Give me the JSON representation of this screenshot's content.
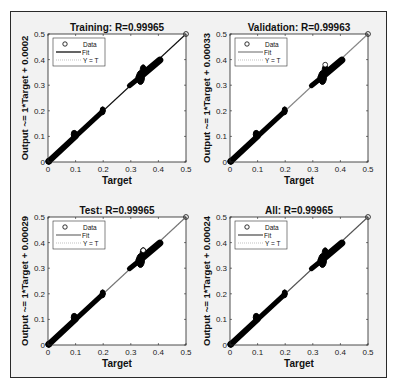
{
  "chart_data": [
    {
      "type": "scatter",
      "title": "Training: R=0.99965",
      "xlabel": "Target",
      "ylabel": "Output ~= 1*Target + 0.0002",
      "xlim": [
        0,
        0.5
      ],
      "ylim": [
        0,
        0.5
      ],
      "xticks": [
        "0",
        "0.1",
        "0.2",
        "0.3",
        "0.4",
        "0.5"
      ],
      "yticks": [
        "0",
        "0.1",
        "0.2",
        "0.3",
        "0.4",
        "0.5"
      ],
      "legend": [
        "Data",
        "Fit",
        "Y = T"
      ],
      "legend_position": "upper left",
      "fit": {
        "slope": 1,
        "intercept": 0.0002
      },
      "R": 0.99965,
      "fit_color": "#111111",
      "series": [
        {
          "name": "Data",
          "segments": [
            [
              0.0,
              0.1
            ],
            [
              0.1,
              0.2
            ],
            [
              0.29,
              0.41
            ]
          ],
          "outliers": [
            [
              0.5,
              0.5
            ]
          ]
        }
      ]
    },
    {
      "type": "scatter",
      "title": "Validation: R=0.99963",
      "xlabel": "Target",
      "ylabel": "Output ~= 1*Target + 0.00033",
      "xlim": [
        0,
        0.5
      ],
      "ylim": [
        0,
        0.5
      ],
      "xticks": [
        "0",
        "0.1",
        "0.2",
        "0.3",
        "0.4",
        "0.5"
      ],
      "yticks": [
        "0",
        "0.1",
        "0.2",
        "0.3",
        "0.4",
        "0.5"
      ],
      "legend": [
        "Data",
        "Fit",
        "Y = T"
      ],
      "legend_position": "upper left",
      "fit": {
        "slope": 1,
        "intercept": 0.00033
      },
      "R": 0.99963,
      "fit_color": "#888888",
      "series": [
        {
          "name": "Data",
          "segments": [
            [
              0.0,
              0.1
            ],
            [
              0.1,
              0.2
            ],
            [
              0.29,
              0.41
            ]
          ],
          "outliers": [
            [
              0.345,
              0.38
            ],
            [
              0.5,
              0.5
            ]
          ]
        }
      ]
    },
    {
      "type": "scatter",
      "title": "Test: R=0.99965",
      "xlabel": "Target",
      "ylabel": "Output ~= 1*Target + 0.00029",
      "xlim": [
        0,
        0.5
      ],
      "ylim": [
        0,
        0.5
      ],
      "xticks": [
        "0",
        "0.1",
        "0.2",
        "0.3",
        "0.4",
        "0.5"
      ],
      "yticks": [
        "0",
        "0.1",
        "0.2",
        "0.3",
        "0.4",
        "0.5"
      ],
      "legend": [
        "Data",
        "Fit",
        "Y = T"
      ],
      "legend_position": "upper left",
      "fit": {
        "slope": 1,
        "intercept": 0.00029
      },
      "R": 0.99965,
      "fit_color": "#777777",
      "series": [
        {
          "name": "Data",
          "segments": [
            [
              0.0,
              0.1
            ],
            [
              0.1,
              0.2
            ],
            [
              0.29,
              0.41
            ]
          ],
          "outliers": [
            [
              0.345,
              0.37
            ],
            [
              0.5,
              0.5
            ]
          ]
        }
      ]
    },
    {
      "type": "scatter",
      "title": "All: R=0.99965",
      "xlabel": "Target",
      "ylabel": "Output ~= 1*Target + 0.00024",
      "xlim": [
        0,
        0.5
      ],
      "ylim": [
        0,
        0.5
      ],
      "xticks": [
        "0",
        "0.1",
        "0.2",
        "0.3",
        "0.4",
        "0.5"
      ],
      "yticks": [
        "0",
        "0.1",
        "0.2",
        "0.3",
        "0.4",
        "0.5"
      ],
      "legend": [
        "Data",
        "Fit",
        "Y = T"
      ],
      "legend_position": "upper left",
      "fit": {
        "slope": 1,
        "intercept": 0.00024
      },
      "R": 0.99965,
      "fit_color": "#555555",
      "series": [
        {
          "name": "Data",
          "segments": [
            [
              0.0,
              0.1
            ],
            [
              0.1,
              0.2
            ],
            [
              0.29,
              0.41
            ]
          ],
          "outliers": [
            [
              0.5,
              0.5
            ]
          ]
        }
      ]
    }
  ],
  "panels": [
    {
      "id": "training",
      "title": "Training: R=0.99965",
      "ylabel": "Output ~= 1*Target + 0.0002",
      "xlabel": "Target",
      "fit_color": "#111111"
    },
    {
      "id": "validation",
      "title": "Validation: R=0.99963",
      "ylabel": "Output ~= 1*Target + 0.00033",
      "xlabel": "Target",
      "fit_color": "#888888"
    },
    {
      "id": "test",
      "title": "Test: R=0.99965",
      "ylabel": "Output ~= 1*Target + 0.00029",
      "xlabel": "Target",
      "fit_color": "#777777"
    },
    {
      "id": "all",
      "title": "All: R=0.99965",
      "ylabel": "Output ~= 1*Target + 0.00024",
      "xlabel": "Target",
      "fit_color": "#555555"
    }
  ],
  "ticks": [
    "0",
    "0.1",
    "0.2",
    "0.3",
    "0.4",
    "0.5"
  ],
  "legend": {
    "data": "Data",
    "fit": "Fit",
    "yt": "Y = T"
  }
}
